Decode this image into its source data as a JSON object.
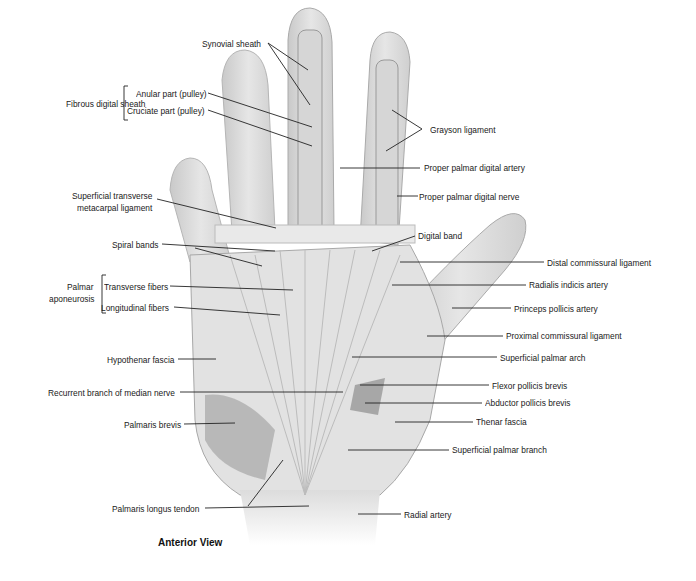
{
  "diagram": {
    "view_title": "Anterior View",
    "groups": {
      "fibrous_digital_sheath": "Fibrous digital sheath",
      "palmar_aponeurosis_line1": "Palmar",
      "palmar_aponeurosis_line2": "aponeurosis"
    },
    "labels_left": [
      {
        "id": "synovial-sheath",
        "text": "Synovial sheath"
      },
      {
        "id": "anular-part",
        "text": "Anular part (pulley)"
      },
      {
        "id": "cruciate-part",
        "text": "Cruciate part (pulley)"
      },
      {
        "id": "superficial-transverse-1",
        "text": "Superficial transverse"
      },
      {
        "id": "superficial-transverse-2",
        "text": "metacarpal ligament"
      },
      {
        "id": "spiral-bands",
        "text": "Spiral bands"
      },
      {
        "id": "transverse-fibers",
        "text": "Transverse fibers"
      },
      {
        "id": "longitudinal-fibers",
        "text": "Longitudinal fibers"
      },
      {
        "id": "hypothenar-fascia",
        "text": "Hypothenar fascia"
      },
      {
        "id": "recurrent-branch",
        "text": "Recurrent branch of median nerve"
      },
      {
        "id": "palmaris-brevis",
        "text": "Palmaris brevis"
      },
      {
        "id": "palmaris-longus",
        "text": "Palmaris longus tendon"
      }
    ],
    "labels_right": [
      {
        "id": "grayson-ligament",
        "text": "Grayson ligament"
      },
      {
        "id": "proper-palmar-digital-artery",
        "text": "Proper palmar digital artery"
      },
      {
        "id": "proper-palmar-digital-nerve",
        "text": "Proper palmar digital nerve"
      },
      {
        "id": "digital-band",
        "text": "Digital band"
      },
      {
        "id": "distal-commissural",
        "text": "Distal commissural ligament"
      },
      {
        "id": "radialis-indicis",
        "text": "Radialis indicis artery"
      },
      {
        "id": "princeps-pollicis",
        "text": "Princeps pollicis artery"
      },
      {
        "id": "proximal-commissural",
        "text": "Proximal commissural ligament"
      },
      {
        "id": "superficial-palmar-arch",
        "text": "Superficial palmar arch"
      },
      {
        "id": "flexor-pollicis-brevis",
        "text": "Flexor pollicis brevis"
      },
      {
        "id": "abductor-pollicis-brevis",
        "text": "Abductor pollicis brevis"
      },
      {
        "id": "thenar-fascia",
        "text": "Thenar fascia"
      },
      {
        "id": "superficial-palmar-branch",
        "text": "Superficial palmar branch"
      },
      {
        "id": "radial-artery",
        "text": "Radial artery"
      }
    ]
  }
}
